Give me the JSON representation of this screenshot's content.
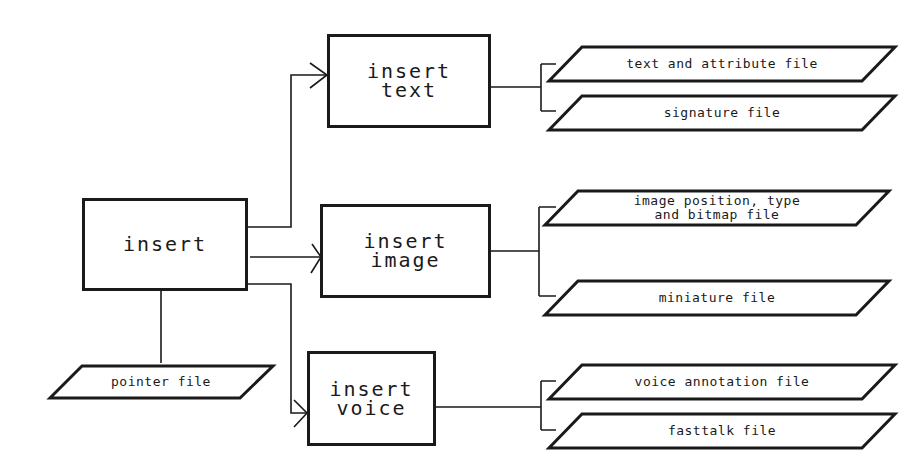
{
  "diagram": {
    "type": "flowchart",
    "processes": {
      "insert": {
        "label": "insert"
      },
      "insert_text": {
        "line1": "insert",
        "line2": "text"
      },
      "insert_image": {
        "line1": "insert",
        "line2": "image"
      },
      "insert_voice": {
        "line1": "insert",
        "line2": "voice"
      }
    },
    "files": {
      "pointer": {
        "label": "pointer file"
      },
      "text_attribute": {
        "label": "text and attribute file"
      },
      "signature": {
        "label": "signature file"
      },
      "image_position": {
        "line1": "image position, type",
        "line2": "and bitmap file"
      },
      "miniature": {
        "label": "miniature file"
      },
      "voice_annotation": {
        "label": "voice annotation file"
      },
      "fasttalk": {
        "label": "fasttalk file"
      }
    },
    "edges": [
      {
        "from": "insert",
        "to": "insert_text",
        "arrow": true
      },
      {
        "from": "insert",
        "to": "insert_image",
        "arrow": true
      },
      {
        "from": "insert",
        "to": "insert_voice",
        "arrow": true
      },
      {
        "from": "insert",
        "to": "pointer",
        "arrow": false
      },
      {
        "from": "insert_text",
        "to": "text_attribute",
        "arrow": false
      },
      {
        "from": "insert_text",
        "to": "signature",
        "arrow": false
      },
      {
        "from": "insert_image",
        "to": "image_position",
        "arrow": false
      },
      {
        "from": "insert_image",
        "to": "miniature",
        "arrow": false
      },
      {
        "from": "insert_voice",
        "to": "voice_annotation",
        "arrow": false
      },
      {
        "from": "insert_voice",
        "to": "fasttalk",
        "arrow": false
      }
    ],
    "colors": {
      "ink": "#1a1a1a",
      "background": "#ffffff"
    }
  }
}
